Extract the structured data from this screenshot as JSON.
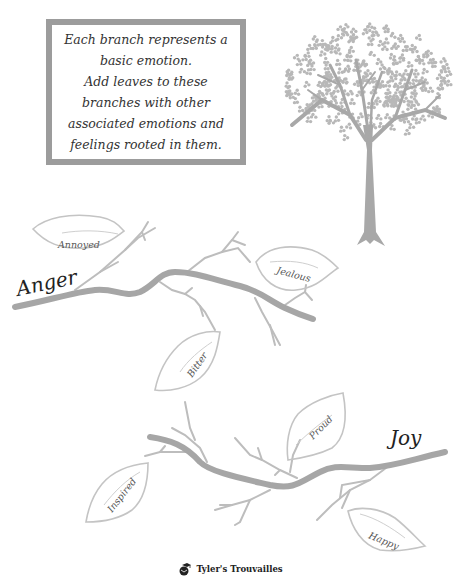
{
  "instructions": {
    "lines": [
      "Each branch represents a",
      "basic emotion.",
      "Add leaves to these",
      "branches with other",
      "associated emotions and",
      "feelings rooted in them."
    ]
  },
  "branches": [
    {
      "emotion": "Anger",
      "leaves": [
        "Annoyed",
        "Jealous",
        "Bitter"
      ]
    },
    {
      "emotion": "Joy",
      "leaves": [
        "Proud",
        "Inspired",
        "Happy"
      ]
    }
  ],
  "footer": {
    "brand": "Tyler's Trouvailles",
    "icon": "graduation-globe-icon"
  },
  "colors": {
    "branch": "#a6a6a6",
    "twig": "#bdbdbd",
    "leaf_outline": "#c4c4c4",
    "frame": "#9c9c9c",
    "tree": "#b0b0b0"
  }
}
